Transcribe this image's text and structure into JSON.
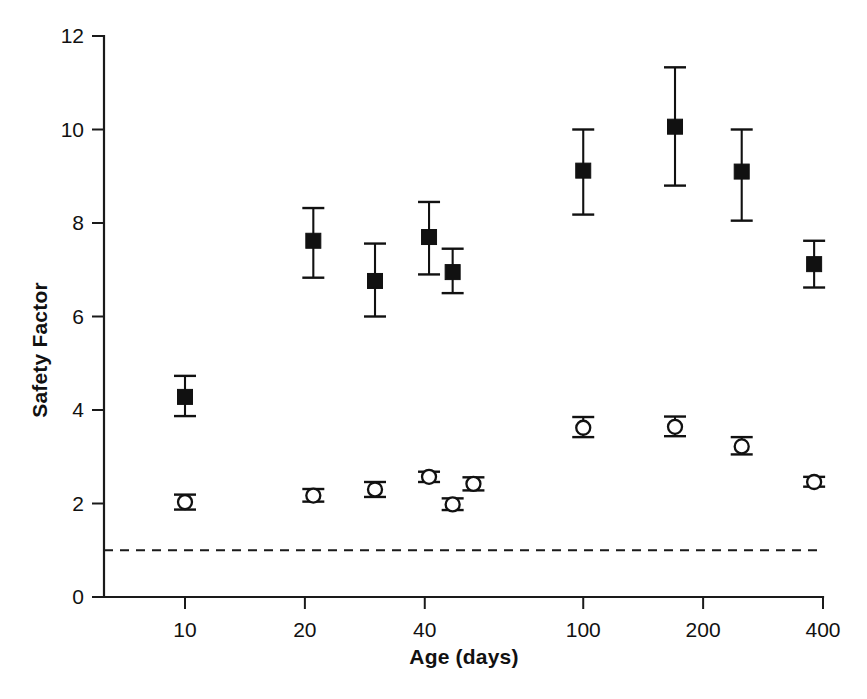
{
  "chart_data": {
    "type": "scatter",
    "title": "",
    "subtitle": "",
    "xlabel": "Age (days)",
    "ylabel": "Safety Factor",
    "xscale": "log",
    "yscale": "linear",
    "xlim": [
      7,
      400
    ],
    "ylim": [
      0,
      12
    ],
    "xticks": [
      10,
      20,
      40,
      100,
      200,
      400
    ],
    "xtick_labels": [
      "10",
      "20",
      "40",
      "100",
      "200",
      "400"
    ],
    "yticks": [
      0,
      2,
      4,
      6,
      8,
      10,
      12
    ],
    "ytick_labels": [
      "0",
      "2",
      "4",
      "6",
      "8",
      "10",
      "12"
    ],
    "grid": false,
    "legend": "none",
    "error_bar_type": "error bars (mean +/- error)",
    "annotations": [
      {
        "type": "horizontal-reference-line",
        "y": 1.0,
        "style": "dashed",
        "label": ""
      }
    ],
    "series": [
      {
        "name": "filled-square-series",
        "marker": "filled-square",
        "color": "#111111",
        "points": [
          {
            "x": 10,
            "y": 4.28,
            "yerr_low": 3.87,
            "yerr_high": 4.73
          },
          {
            "x": 21,
            "y": 7.62,
            "yerr_low": 6.83,
            "yerr_high": 8.32
          },
          {
            "x": 30,
            "y": 6.76,
            "yerr_low": 6.0,
            "yerr_high": 7.56
          },
          {
            "x": 41,
            "y": 7.7,
            "yerr_low": 6.9,
            "yerr_high": 8.45
          },
          {
            "x": 47,
            "y": 6.95,
            "yerr_low": 6.5,
            "yerr_high": 7.45
          },
          {
            "x": 100,
            "y": 9.12,
            "yerr_low": 8.18,
            "yerr_high": 10.0
          },
          {
            "x": 170,
            "y": 10.06,
            "yerr_low": 8.8,
            "yerr_high": 11.33
          },
          {
            "x": 250,
            "y": 9.1,
            "yerr_low": 8.05,
            "yerr_high": 10.0
          },
          {
            "x": 380,
            "y": 7.12,
            "yerr_low": 6.62,
            "yerr_high": 7.62
          }
        ]
      },
      {
        "name": "open-circle-series",
        "marker": "open-circle",
        "color": "#111111",
        "points": [
          {
            "x": 10,
            "y": 2.03,
            "yerr_low": 1.87,
            "yerr_high": 2.19
          },
          {
            "x": 21,
            "y": 2.17,
            "yerr_low": 2.04,
            "yerr_high": 2.31
          },
          {
            "x": 30,
            "y": 2.3,
            "yerr_low": 2.14,
            "yerr_high": 2.46
          },
          {
            "x": 41,
            "y": 2.57,
            "yerr_low": 2.46,
            "yerr_high": 2.68
          },
          {
            "x": 47,
            "y": 1.98,
            "yerr_low": 1.86,
            "yerr_high": 2.11
          },
          {
            "x": 53,
            "y": 2.42,
            "yerr_low": 2.28,
            "yerr_high": 2.56
          },
          {
            "x": 100,
            "y": 3.62,
            "yerr_low": 3.42,
            "yerr_high": 3.85
          },
          {
            "x": 170,
            "y": 3.64,
            "yerr_low": 3.44,
            "yerr_high": 3.86
          },
          {
            "x": 250,
            "y": 3.22,
            "yerr_low": 3.05,
            "yerr_high": 3.42
          },
          {
            "x": 380,
            "y": 2.46,
            "yerr_low": 2.36,
            "yerr_high": 2.57
          }
        ]
      }
    ]
  },
  "axes": {
    "ylabel": "Safety Factor",
    "xlabel": "Age (days)",
    "ytick_labels": [
      "12",
      "10",
      "8",
      "6",
      "4",
      "2",
      "0"
    ],
    "xtick_labels": [
      "10",
      "20",
      "40",
      "100",
      "200",
      "400"
    ]
  }
}
